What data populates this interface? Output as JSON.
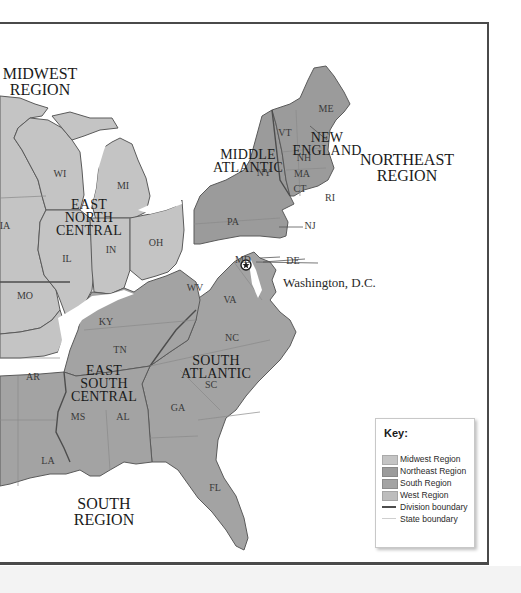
{
  "colors": {
    "midwest": "#c4c4c4",
    "northeast": "#9b9b9b",
    "south": "#a3a3a3",
    "west": "#bdbdbd",
    "division_boundary": "#5a5a5a",
    "state_boundary": "#cfcfcf",
    "frame": "#4a4a4a"
  },
  "regions": [
    {
      "id": "midwest",
      "label_line1": "MIDWEST",
      "label_line2": "REGION"
    },
    {
      "id": "northeast",
      "label_line1": "NORTHEAST",
      "label_line2": "REGION"
    },
    {
      "id": "south",
      "label_line1": "SOUTH",
      "label_line2": "REGION"
    }
  ],
  "divisions": [
    {
      "id": "east-north-central",
      "lines": [
        "EAST",
        "NORTH",
        "CENTRAL"
      ]
    },
    {
      "id": "middle-atlantic",
      "lines": [
        "MIDDLE",
        "ATLANTIC"
      ]
    },
    {
      "id": "new-england",
      "lines": [
        "NEW",
        "ENGLAND"
      ]
    },
    {
      "id": "south-atlantic",
      "lines": [
        "SOUTH",
        "ATLANTIC"
      ]
    },
    {
      "id": "east-south-central",
      "lines": [
        "EAST",
        "SOUTH",
        "CENTRAL"
      ]
    }
  ],
  "states": {
    "WI": "WI",
    "MI": "MI",
    "IA": "IA",
    "IL": "IL",
    "IN": "IN",
    "OH": "OH",
    "MO": "MO",
    "ME": "ME",
    "VT": "VT",
    "NH": "NH",
    "MA": "MA",
    "CT": "CT",
    "RI": "RI",
    "NY": "NY",
    "PA": "PA",
    "NJ": "NJ",
    "DE": "DE",
    "MD": "MD",
    "WV": "WV",
    "VA": "VA",
    "KY": "KY",
    "NC": "NC",
    "TN": "TN",
    "SC": "SC",
    "AR": "AR",
    "MS": "MS",
    "AL": "AL",
    "GA": "GA",
    "LA": "LA",
    "FL": "FL"
  },
  "callouts": {
    "capital": "Washington, D.C."
  },
  "key": {
    "title": "Key:",
    "items": [
      {
        "label": "Midwest Region",
        "type": "fill"
      },
      {
        "label": "Northeast Region",
        "type": "fill"
      },
      {
        "label": "South Region",
        "type": "fill"
      },
      {
        "label": "West Region",
        "type": "fill"
      },
      {
        "label": "Division boundary",
        "type": "line"
      },
      {
        "label": "State boundary",
        "type": "line"
      }
    ]
  }
}
